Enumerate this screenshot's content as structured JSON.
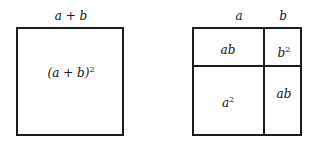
{
  "left_figure": {
    "top_label": "a + b",
    "area_label": "(a + b)",
    "area_exponent": "2"
  },
  "right_figure": {
    "top_labels": [
      "a",
      "b"
    ],
    "cells": {
      "top_left": {
        "base": "ab",
        "exp": ""
      },
      "top_right": {
        "base": "b",
        "exp": "2"
      },
      "bottom_left": {
        "base": "a",
        "exp": "2"
      },
      "bottom_right": {
        "base": "ab",
        "exp": ""
      }
    }
  },
  "colors": {
    "stroke": "#1a1a1a",
    "background": "#ffffff"
  }
}
